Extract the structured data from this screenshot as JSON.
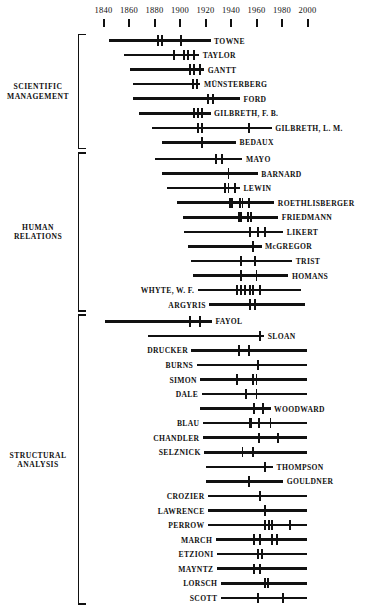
{
  "chart_data": {
    "type": "table",
    "title": "",
    "subtitle": "",
    "xlabel": "",
    "ylabel": "",
    "xlim": [
      1830,
      2010
    ],
    "grid": false,
    "legend": "none",
    "axis": {
      "ticks": [
        1840,
        1860,
        1880,
        1900,
        1920,
        1940,
        1960,
        1980,
        2000
      ],
      "tick_labels": [
        "1840",
        "1860",
        "1880",
        "1900",
        "1920",
        "1940",
        "1960",
        "1980",
        "2000"
      ]
    },
    "groups": [
      {
        "label": "SCIENTIFIC\nMANAGEMENT",
        "rows": [
          {
            "name": "TOWNE",
            "label_side": "right",
            "start": 1844,
            "end": 1924,
            "marks": [
              1883,
              1886,
              1901
            ]
          },
          {
            "name": "TAYLOR",
            "label_side": "right",
            "start": 1856,
            "end": 1915,
            "marks": [
              1895,
              1903,
              1906,
              1911
            ]
          },
          {
            "name": "GANTT",
            "label_side": "right",
            "start": 1861,
            "end": 1919,
            "marks": [
              1908,
              1911,
              1916
            ]
          },
          {
            "name": "MÜNSTERBERG",
            "label_side": "right",
            "start": 1863,
            "end": 1916,
            "marks": [
              1910,
              1913
            ]
          },
          {
            "name": "FORD",
            "label_side": "right",
            "start": 1863,
            "end": 1947,
            "marks": [
              1922,
              1926
            ]
          },
          {
            "name": "GILBRETH, F. B.",
            "label_side": "right",
            "start": 1868,
            "end": 1924,
            "marks": [
              1911,
              1914,
              1917
            ]
          },
          {
            "name": "GILBRETH, L. M.",
            "label_side": "right",
            "start": 1878,
            "end": 1972,
            "marks": [
              1914,
              1917,
              1954
            ]
          },
          {
            "name": "BEDAUX",
            "label_side": "right",
            "start": 1886,
            "end": 1944,
            "marks": [
              1917
            ]
          }
        ]
      },
      {
        "label": "HUMAN\nRELATIONS",
        "rows": [
          {
            "name": "MAYO",
            "label_side": "right",
            "start": 1880,
            "end": 1949,
            "marks": [
              1928,
              1933
            ]
          },
          {
            "name": "BARNARD",
            "label_side": "right",
            "start": 1886,
            "end": 1961,
            "marks": [
              1938
            ]
          },
          {
            "name": "LEWIN",
            "label_side": "right",
            "start": 1890,
            "end": 1947,
            "marks": [
              1935,
              1938,
              1943
            ]
          },
          {
            "name": "ROETHLISBERGER",
            "label_side": "right",
            "start": 1898,
            "end": 1974,
            "marks": [
              1939,
              1941,
              1947,
              1949,
              1954
            ]
          },
          {
            "name": "FRIEDMANN",
            "label_side": "right",
            "start": 1902,
            "end": 1977,
            "marks": [
              1946,
              1948,
              1953,
              1956
            ]
          },
          {
            "name": "LIKERT",
            "label_side": "right",
            "start": 1903,
            "end": 1981,
            "marks": [
              1955,
              1961,
              1967
            ]
          },
          {
            "name": "McGREGOR",
            "label_side": "right",
            "start": 1906,
            "end": 1964,
            "marks": [
              1957
            ]
          },
          {
            "name": "TRIST",
            "label_side": "right",
            "start": 1909,
            "end": 1988,
            "marks": [
              1948,
              1959
            ]
          },
          {
            "name": "HOMANS",
            "label_side": "right",
            "start": 1910,
            "end": 1985,
            "marks": [
              1948,
              1960
            ]
          },
          {
            "name": "WHYTE, W. F.",
            "label_side": "left",
            "start": 1914,
            "end": 1995,
            "marks": [
              1945,
              1948,
              1951,
              1955,
              1957,
              1963
            ]
          },
          {
            "name": "ARGYRIS",
            "label_side": "left",
            "start": 1923,
            "end": 1998,
            "marks": [
              1955,
              1959
            ]
          }
        ]
      },
      {
        "label": "STRUCTURAL\nANALYSIS",
        "rows": [
          {
            "name": "FAYOL",
            "label_side": "right",
            "start": 1841,
            "end": 1925,
            "marks": [
              1908,
              1916
            ]
          },
          {
            "name": "SLOAN",
            "label_side": "right",
            "start": 1875,
            "end": 1966,
            "marks": [
              1963
            ]
          },
          {
            "name": "DRUCKER",
            "label_side": "left",
            "start": 1909,
            "end": 2000,
            "marks": [
              1946,
              1954
            ]
          },
          {
            "name": "BURNS",
            "label_side": "left",
            "start": 1913,
            "end": 2000,
            "marks": [
              1961
            ]
          },
          {
            "name": "SIMON",
            "label_side": "left",
            "start": 1916,
            "end": 2000,
            "marks": [
              1945,
              1957,
              1960
            ]
          },
          {
            "name": "DALE",
            "label_side": "left",
            "start": 1917,
            "end": 2000,
            "marks": [
              1952,
              1960
            ]
          },
          {
            "name": "WOODWARD",
            "label_side": "right",
            "start": 1916,
            "end": 1971,
            "marks": [
              1958,
              1965
            ]
          },
          {
            "name": "BLAU",
            "label_side": "left",
            "start": 1918,
            "end": 2000,
            "marks": [
              1955,
              1956,
              1962,
              1971
            ]
          },
          {
            "name": "CHANDLER",
            "label_side": "left",
            "start": 1918,
            "end": 2000,
            "marks": [
              1962,
              1977
            ]
          },
          {
            "name": "SELZNICK",
            "label_side": "left",
            "start": 1919,
            "end": 2000,
            "marks": [
              1949,
              1957
            ]
          },
          {
            "name": "THOMPSON",
            "label_side": "right",
            "start": 1920,
            "end": 1973,
            "marks": [
              1967
            ]
          },
          {
            "name": "GOULDNER",
            "label_side": "right",
            "start": 1920,
            "end": 1981,
            "marks": [
              1954
            ]
          },
          {
            "name": "CROZIER",
            "label_side": "left",
            "start": 1922,
            "end": 2000,
            "marks": [
              1963
            ]
          },
          {
            "name": "LAWRENCE",
            "label_side": "left",
            "start": 1922,
            "end": 2000,
            "marks": [
              1967
            ]
          },
          {
            "name": "PERROW",
            "label_side": "left",
            "start": 1922,
            "end": 2000,
            "marks": [
              1967,
              1970,
              1972,
              1986
            ]
          },
          {
            "name": "MARCH",
            "label_side": "left",
            "start": 1928,
            "end": 2000,
            "marks": [
              1958,
              1963,
              1972,
              1976
            ]
          },
          {
            "name": "ETZIONI",
            "label_side": "left",
            "start": 1929,
            "end": 2000,
            "marks": [
              1961,
              1964
            ]
          },
          {
            "name": "MAYNTZ",
            "label_side": "left",
            "start": 1929,
            "end": 2000,
            "marks": [
              1958,
              1963
            ]
          },
          {
            "name": "LORSCH",
            "label_side": "left",
            "start": 1932,
            "end": 2000,
            "marks": [
              1967,
              1969
            ]
          },
          {
            "name": "SCOTT",
            "label_side": "left",
            "start": 1932,
            "end": 2000,
            "marks": [
              1961,
              1981
            ]
          }
        ]
      }
    ]
  }
}
